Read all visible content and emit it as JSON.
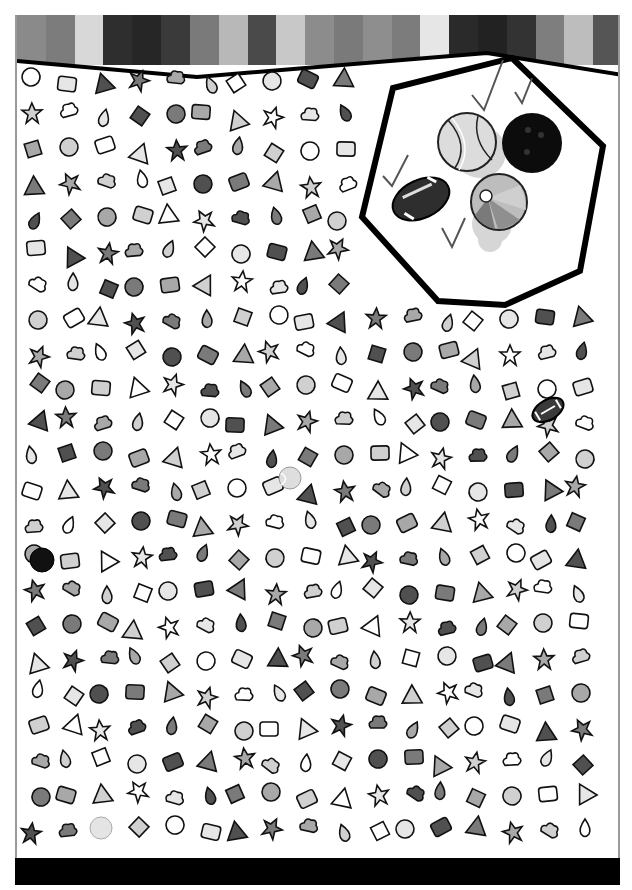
{
  "puzzle": {
    "type": "seek-and-find",
    "header_stripes": [
      "#8a8a8a",
      "#7c7c7c",
      "#d8d8d8",
      "#2e2e2e",
      "#262626",
      "#3a3a3a",
      "#7a7a7a",
      "#b8b8b8",
      "#4a4a4a",
      "#c8c8c8",
      "#8c8c8c",
      "#7a7a7a",
      "#8e8e8e",
      "#7c7c7c",
      "#e6e6e6",
      "#2a2a2a",
      "#222222",
      "#333333",
      "#7e7e7e",
      "#bdbdbd",
      "#555555"
    ],
    "footer_color": "#000000",
    "targets_panel": {
      "shape": "hexagon",
      "items": [
        {
          "name": "tennis ball",
          "found": true,
          "check": "✓"
        },
        {
          "name": "bowling ball",
          "found": true,
          "check": "✓"
        },
        {
          "name": "football",
          "found": true,
          "check": "✓"
        },
        {
          "name": "beach ball",
          "found": true,
          "check": "✓"
        }
      ]
    },
    "hidden_targets_in_scene": [
      {
        "name": "football",
        "x": 545,
        "y": 410
      },
      {
        "name": "bowling ball",
        "x": 40,
        "y": 560
      },
      {
        "name": "tennis ball",
        "x": 290,
        "y": 478
      },
      {
        "name": "tennis ball",
        "x": 100,
        "y": 827
      }
    ],
    "scene_objects": [
      "stacked papers",
      "paintbrush",
      "globe",
      "jar",
      "sneaker",
      "bell",
      "graduation cap",
      "cross",
      "headphones",
      "speech bubbles",
      "planet",
      "paper plane",
      "ice cream cone",
      "number 2",
      "number 5",
      "backpack",
      "coffee cup",
      "teacup",
      "molecule",
      "school building",
      "tape dispenser",
      "bandage",
      "id card",
      "calculator phone",
      "cloud",
      "bottle",
      "camera",
      "spatula",
      "balloon",
      "arrow",
      "shopping cart",
      "scales",
      "weight kg",
      "briefcase",
      "bell",
      "tree",
      "gingerbread man",
      "daisy",
      "high heel",
      "lipstick",
      "wheel",
      "bottle",
      "x mark",
      "warning sign",
      "movie camera",
      "fork",
      "car",
      "gear",
      "floppy disk",
      "pacman",
      "bank",
      "doll",
      "hot dog",
      "pine tree",
      "drink",
      "hat",
      "umbrella",
      "chair",
      "key",
      "dog",
      "nut",
      "phone",
      "tie",
      "cake slice",
      "cactus",
      "bus",
      "candy",
      "barrel",
      "gift",
      "shoe",
      "briefcase",
      "dish soap",
      "book",
      "bowl",
      "leaf",
      "palette",
      "match",
      "glasses",
      "factory",
      "croissant",
      "clock",
      "recycle arrows",
      "magnifier",
      "shopping bag",
      "pencil cup",
      "flag",
      "speech bubble",
      "hand pointing",
      "padlock",
      "peace sign",
      "envelope",
      "jam jar",
      "key",
      "drop",
      "heart",
      "toothpaste",
      "tv",
      "globe",
      "grenade",
      "star",
      "rocket",
      "money bag",
      "sailboat",
      "house",
      "popcorn",
      "blood drop",
      "wrench",
      "compass tool",
      "radiation",
      "ship",
      "candle",
      "boot",
      "button",
      "knife",
      "flower",
      "camera",
      "spellbook",
      "car",
      "sneaker",
      "sun face",
      "t-shirt",
      "bow",
      "jar",
      "racket",
      "paperclip",
      "apple",
      "paint palette",
      "saw key",
      "hammer",
      "baby bottle",
      "eye",
      "plug",
      "airplane",
      "rollerskate",
      "glasses",
      "fish",
      "mouse",
      "bicycle",
      "watering can",
      "horseshoe",
      "padlock",
      "lollipop",
      "spatula",
      "spoon",
      "floppy",
      "small house",
      "shopping bag",
      "scroll",
      "daisy",
      "orange",
      "badminton shuttle",
      "snowflake",
      "cookie",
      "telephone",
      "ice cream",
      "smiley sun",
      "toilet paper",
      "vase",
      "candle",
      "money bag",
      "marker",
      "rocket",
      "bottle",
      "ribbon",
      "bike",
      "snail"
    ]
  }
}
